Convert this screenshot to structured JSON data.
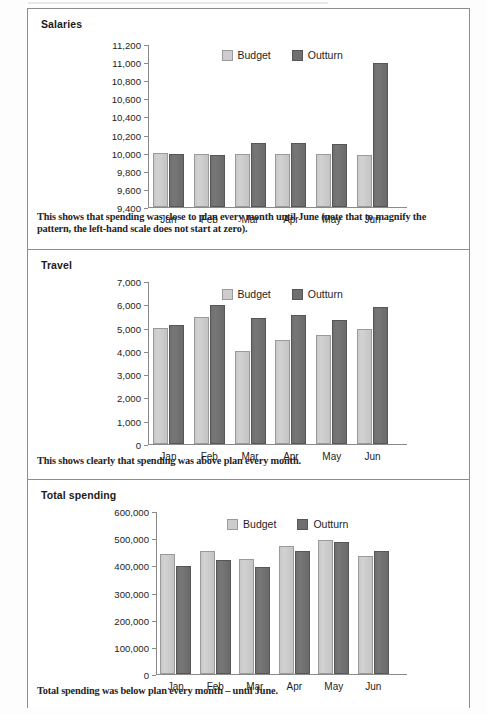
{
  "colors": {
    "budget": "#cdcdcd",
    "outturn": "#6f6f6f",
    "frame_border": "#8d8d8d",
    "axis": "#8a8a8a",
    "text": "#1d1d1d"
  },
  "legend": {
    "budget_label": "Budget",
    "outturn_label": "Outturn"
  },
  "panels": [
    {
      "title": "Salaries",
      "caption": "This shows that spending was close to plan every month until June (note that to magnify the pattern, the left-hand scale does not start at zero)."
    },
    {
      "title": "Travel",
      "caption": "This shows clearly that spending was above plan every month."
    },
    {
      "title": "Total spending",
      "caption": "Total spending was below plan every month – until June."
    }
  ],
  "chart_data": [
    {
      "type": "bar",
      "title": "Salaries",
      "xlabel": "",
      "ylabel": "",
      "categories": [
        "Jan",
        "Feb",
        "Mar",
        "Apr",
        "May",
        "Jun"
      ],
      "series": [
        {
          "name": "Budget",
          "values": [
            10000,
            9990,
            9990,
            9990,
            9985,
            9975
          ]
        },
        {
          "name": "Outturn",
          "values": [
            9985,
            9975,
            10110,
            10105,
            10100,
            10990
          ]
        }
      ],
      "ylim": [
        9400,
        11200
      ],
      "yticks": [
        9400,
        9600,
        9800,
        10000,
        10200,
        10400,
        10600,
        10800,
        11000,
        11200
      ],
      "ytick_labels": [
        "9,400",
        "9,600",
        "9,800",
        "10,000",
        "10,200",
        "10,400",
        "10,600",
        "10,800",
        "11,000",
        "11,200"
      ],
      "grid": false,
      "legend_position": "top-center"
    },
    {
      "type": "bar",
      "title": "Travel",
      "xlabel": "",
      "ylabel": "",
      "categories": [
        "Jan",
        "Feb",
        "Mar",
        "Apr",
        "May",
        "Jun"
      ],
      "series": [
        {
          "name": "Budget",
          "values": [
            5000,
            5450,
            3980,
            4470,
            4670,
            4930
          ]
        },
        {
          "name": "Outturn",
          "values": [
            5120,
            5960,
            5400,
            5520,
            5330,
            5900
          ]
        }
      ],
      "ylim": [
        0,
        7000
      ],
      "yticks": [
        0,
        1000,
        2000,
        3000,
        4000,
        5000,
        6000,
        7000
      ],
      "ytick_labels": [
        "0",
        "1,000",
        "2,000",
        "3,000",
        "4,000",
        "5,000",
        "6,000",
        "7,000"
      ],
      "grid": false,
      "legend_position": "top-center"
    },
    {
      "type": "bar",
      "title": "Total spending",
      "xlabel": "",
      "ylabel": "",
      "categories": [
        "Jan",
        "Feb",
        "Mar",
        "Apr",
        "May",
        "Jun"
      ],
      "series": [
        {
          "name": "Budget",
          "values": [
            440000,
            453000,
            423000,
            472000,
            493000,
            435000
          ]
        },
        {
          "name": "Outturn",
          "values": [
            398000,
            420000,
            395000,
            451000,
            485000,
            453000
          ]
        }
      ],
      "ylim": [
        0,
        600000
      ],
      "yticks": [
        0,
        100000,
        200000,
        300000,
        400000,
        500000,
        600000
      ],
      "ytick_labels": [
        "0",
        "100,000",
        "200,000",
        "300,000",
        "400,000",
        "500,000",
        "600,000"
      ],
      "grid": false,
      "legend_position": "top-center"
    }
  ]
}
